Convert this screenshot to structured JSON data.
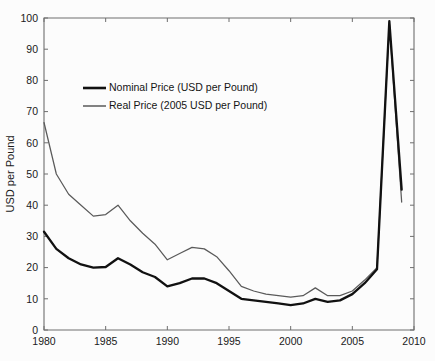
{
  "chart_data": {
    "type": "line",
    "title": "",
    "subtitle": "",
    "xlabel": "",
    "ylabel": "USD per Pound",
    "xlim": [
      1980,
      2010
    ],
    "ylim": [
      0,
      100
    ],
    "grid": false,
    "legend_position": "upper-left-inside",
    "x_ticks": [
      1980,
      1985,
      1990,
      1995,
      2000,
      2005,
      2010
    ],
    "y_ticks": [
      0,
      10,
      20,
      30,
      40,
      50,
      60,
      70,
      80,
      90,
      100
    ],
    "x": [
      1980,
      1981,
      1982,
      1983,
      1984,
      1985,
      1986,
      1987,
      1988,
      1989,
      1990,
      1991,
      1992,
      1993,
      1994,
      1995,
      1996,
      1997,
      1998,
      1999,
      2000,
      2001,
      2002,
      2003,
      2004,
      2005,
      2006,
      2007,
      2008,
      2009
    ],
    "series": [
      {
        "name": "Nominal Price (USD per Pound)",
        "color": "#111111",
        "values": [
          31.5,
          26.0,
          23.0,
          21.0,
          20.0,
          20.2,
          23.0,
          21.0,
          18.5,
          17.0,
          14.0,
          15.0,
          16.5,
          16.5,
          15.0,
          12.5,
          10.0,
          9.5,
          9.0,
          8.5,
          8.0,
          8.5,
          10.0,
          9.0,
          9.5,
          11.5,
          15.0,
          19.5,
          99.0,
          45.0
        ],
        "style": "thick-black"
      },
      {
        "name": "Real Price (2005 USD per Pound)",
        "color": "#5a5a5a",
        "values": [
          66.5,
          50.0,
          43.5,
          40.0,
          36.5,
          37.0,
          40.0,
          35.0,
          31.0,
          27.5,
          22.5,
          24.5,
          26.5,
          26.0,
          23.5,
          19.0,
          14.0,
          12.5,
          11.5,
          11.0,
          10.5,
          11.0,
          13.5,
          11.0,
          11.0,
          12.5,
          16.0,
          20.0,
          98.5,
          41.0
        ],
        "style": "thin-gray"
      }
    ]
  },
  "legend": {
    "items": [
      {
        "label": "Nominal Price (USD per Pound)",
        "swatch": "thick-black-line"
      },
      {
        "label": "Real Price (2005 USD per Pound)",
        "swatch": "thin-gray-line"
      }
    ]
  },
  "axes": {
    "y_title": "USD per Pound",
    "y_tick_labels": [
      "0",
      "10",
      "20",
      "30",
      "40",
      "50",
      "60",
      "70",
      "80",
      "90",
      "100"
    ],
    "x_tick_labels": [
      "1980",
      "1985",
      "1990",
      "1995",
      "2000",
      "2005",
      "2010"
    ]
  },
  "colors": {
    "nominal": "#111111",
    "real": "#5a5a5a",
    "axis": "#6e6e6e",
    "background": "#fcfcfc",
    "text": "#1a1a1a"
  }
}
